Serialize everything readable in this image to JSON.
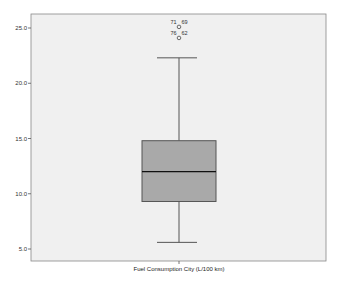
{
  "chart_data": {
    "type": "boxplot",
    "title": "",
    "xlabel": "Fuel Consumption City (L/100 km)",
    "ylabel": "",
    "ylim": [
      4.0,
      26.2
    ],
    "yticks": [
      5.0,
      10.0,
      15.0,
      20.0,
      25.0
    ],
    "ytick_labels": [
      "5.0",
      "10.0",
      "15.0",
      "20.0",
      "25.0"
    ],
    "categories": [
      "Fuel Consumption City (L/100 km)"
    ],
    "grid": false,
    "legend": null,
    "series": [
      {
        "name": "Fuel Consumption City (L/100 km)",
        "whisker_low": 5.6,
        "q1": 9.3,
        "median": 12.0,
        "q3": 14.8,
        "whisker_high": 22.3,
        "outliers": [
          {
            "value": 25.1,
            "labels": [
              "71",
              "69"
            ]
          },
          {
            "value": 24.1,
            "labels": [
              "76",
              "62"
            ]
          }
        ]
      }
    ],
    "colors": {
      "plot_background": "#f0f0f0",
      "box_fill": "#a9a9a9",
      "box_stroke": "#555555",
      "median_line": "#111111",
      "whisker": "#555555"
    }
  }
}
